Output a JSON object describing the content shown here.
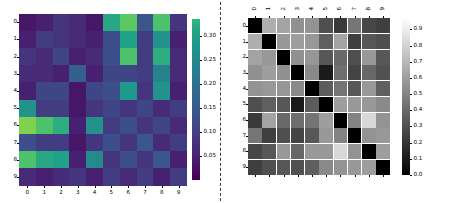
{
  "figure": {
    "background_color": "#ffffff",
    "divider": {
      "name": "panel-divider",
      "style": "dashed",
      "color": "#3a3a3a"
    }
  },
  "chart_data": [
    {
      "type": "heatmap",
      "name": "left-heatmap",
      "title": "",
      "xlabel": "",
      "ylabel": "",
      "colormap": "viridis",
      "grid": false,
      "legend_position": "right",
      "xticklabels": [
        "0",
        "1",
        "2",
        "3",
        "4",
        "5",
        "6",
        "7",
        "8",
        "9"
      ],
      "yticklabels": [
        "0",
        "1",
        "2",
        "3",
        "4",
        "5",
        "6",
        "7",
        "8",
        "9"
      ],
      "xtick_rotation": 0,
      "ytick_rotation": 0,
      "colorbar": {
        "ticks": [
          "0.05",
          "0.10",
          "0.15",
          "0.20",
          "0.25",
          "0.30"
        ],
        "tick_values": [
          0.05,
          0.1,
          0.15,
          0.2,
          0.25,
          0.3
        ],
        "vmin": 0.0,
        "vmax": 0.335
      },
      "values": [
        [
          0.02,
          0.03,
          0.05,
          0.04,
          0.02,
          0.2,
          0.25,
          0.09,
          0.24,
          0.05
        ],
        [
          0.03,
          0.06,
          0.05,
          0.04,
          0.03,
          0.08,
          0.19,
          0.06,
          0.17,
          0.03
        ],
        [
          0.05,
          0.04,
          0.07,
          0.03,
          0.04,
          0.08,
          0.24,
          0.06,
          0.21,
          0.04
        ],
        [
          0.04,
          0.04,
          0.03,
          0.1,
          0.03,
          0.07,
          0.07,
          0.06,
          0.15,
          0.04
        ],
        [
          0.03,
          0.07,
          0.07,
          0.02,
          0.07,
          0.08,
          0.18,
          0.05,
          0.17,
          0.03
        ],
        [
          0.17,
          0.06,
          0.06,
          0.02,
          0.05,
          0.07,
          0.05,
          0.07,
          0.04,
          0.06
        ],
        [
          0.27,
          0.24,
          0.21,
          0.03,
          0.17,
          0.06,
          0.08,
          0.05,
          0.07,
          0.04
        ],
        [
          0.08,
          0.06,
          0.06,
          0.02,
          0.05,
          0.08,
          0.05,
          0.09,
          0.04,
          0.06
        ],
        [
          0.24,
          0.2,
          0.19,
          0.03,
          0.16,
          0.05,
          0.08,
          0.05,
          0.09,
          0.03
        ],
        [
          0.04,
          0.03,
          0.04,
          0.05,
          0.03,
          0.06,
          0.04,
          0.06,
          0.03,
          0.06
        ]
      ]
    },
    {
      "type": "heatmap",
      "name": "right-heatmap",
      "title": "",
      "xlabel": "",
      "ylabel": "",
      "colormap": "grey",
      "grid": true,
      "legend_position": "right",
      "xticklabels": [
        "0",
        "1",
        "2",
        "3",
        "4",
        "5",
        "6",
        "7",
        "8",
        "9"
      ],
      "yticklabels": [
        "0",
        "1",
        "2",
        "3",
        "4",
        "5",
        "6",
        "7",
        "8",
        "9"
      ],
      "xtick_rotation": 90,
      "ytick_rotation": 0,
      "colorbar": {
        "ticks": [
          "0.0",
          "0.1",
          "0.2",
          "0.3",
          "0.4",
          "0.5",
          "0.6",
          "0.7",
          "0.8",
          "0.9"
        ],
        "tick_values": [
          0.0,
          0.1,
          0.2,
          0.3,
          0.4,
          0.5,
          0.6,
          0.7,
          0.8,
          0.9
        ],
        "vmin": 0.0,
        "vmax": 0.97
      },
      "values": [
        [
          0.0,
          0.66,
          0.62,
          0.55,
          0.56,
          0.3,
          0.22,
          0.45,
          0.27,
          0.24
        ],
        [
          0.66,
          0.0,
          0.58,
          0.6,
          0.58,
          0.36,
          0.62,
          0.24,
          0.33,
          0.3
        ],
        [
          0.62,
          0.58,
          0.0,
          0.55,
          0.57,
          0.33,
          0.4,
          0.3,
          0.58,
          0.33
        ],
        [
          0.55,
          0.6,
          0.55,
          0.0,
          0.52,
          0.1,
          0.42,
          0.26,
          0.39,
          0.31
        ],
        [
          0.56,
          0.58,
          0.57,
          0.52,
          0.0,
          0.35,
          0.44,
          0.33,
          0.58,
          0.36
        ],
        [
          0.3,
          0.36,
          0.33,
          0.1,
          0.35,
          0.0,
          0.6,
          0.58,
          0.58,
          0.52
        ],
        [
          0.22,
          0.62,
          0.4,
          0.42,
          0.44,
          0.6,
          0.0,
          0.5,
          0.82,
          0.56
        ],
        [
          0.45,
          0.24,
          0.3,
          0.26,
          0.33,
          0.58,
          0.5,
          0.0,
          0.56,
          0.58
        ],
        [
          0.27,
          0.33,
          0.58,
          0.39,
          0.58,
          0.58,
          0.82,
          0.56,
          0.0,
          0.6
        ],
        [
          0.24,
          0.3,
          0.33,
          0.31,
          0.36,
          0.52,
          0.56,
          0.58,
          0.6,
          0.0
        ]
      ]
    }
  ]
}
